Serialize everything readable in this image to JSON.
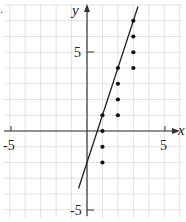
{
  "chart_data": {
    "type": "scatter",
    "title": "",
    "xlabel": "x",
    "ylabel": "y",
    "xlim": [
      -5.5,
      6
    ],
    "ylim": [
      -5.5,
      7.8
    ],
    "grid": true,
    "x_tick_labels": [
      "-5",
      "5"
    ],
    "y_tick_labels": [
      "5",
      "-5"
    ],
    "series": [
      {
        "name": "points",
        "points": [
          {
            "x": 1,
            "y": 1
          },
          {
            "x": 1,
            "y": 0
          },
          {
            "x": 1,
            "y": -1
          },
          {
            "x": 1,
            "y": -2
          },
          {
            "x": 2,
            "y": 1
          },
          {
            "x": 2,
            "y": 2
          },
          {
            "x": 2,
            "y": 3
          },
          {
            "x": 2,
            "y": 4
          },
          {
            "x": 3,
            "y": 4
          },
          {
            "x": 3,
            "y": 5
          },
          {
            "x": 3,
            "y": 6
          },
          {
            "x": 3,
            "y": 7
          }
        ]
      },
      {
        "name": "line",
        "type": "line",
        "equation": "y = 3x - 2",
        "points": [
          {
            "x": -0.55,
            "y": -3.65
          },
          {
            "x": 3.3,
            "y": 7.9
          }
        ]
      }
    ]
  },
  "labels": {
    "x_axis": "x",
    "y_axis": "y",
    "x_neg": "-5",
    "x_pos": "5",
    "y_pos": "5",
    "y_neg": "-5",
    "corner_fragment": "."
  }
}
